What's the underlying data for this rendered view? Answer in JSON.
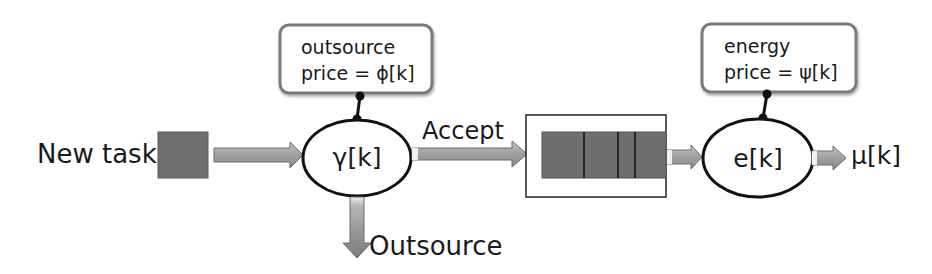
{
  "diagram": {
    "input": {
      "label": "New task"
    },
    "admission": {
      "node_label": "γ[k]",
      "price_box": {
        "line1": "outsource",
        "line2": "price = ϕ[k]"
      },
      "accept_label": "Accept",
      "outsource_label": "Outsource"
    },
    "queue": {
      "segments": 4
    },
    "server": {
      "node_label": "e[k]",
      "price_box": {
        "line1": "energy",
        "line2": "price = ψ[k]"
      },
      "output_label": "μ[k]"
    },
    "colors": {
      "task_fill": "#6f6f6f",
      "queue_fill": "#6e6e6e",
      "arrow_fill": "#a8a8a8",
      "arrow_stroke": "#6a6a6a",
      "box_border": "#7a7a7a",
      "line": "#111111"
    }
  }
}
